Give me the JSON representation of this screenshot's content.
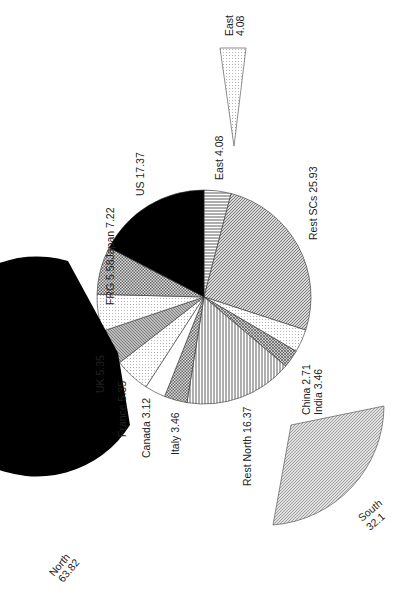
{
  "chart_data": {
    "type": "pie",
    "title": "",
    "orientation": "rotated 90 degrees counter-clockwise",
    "main_pie": {
      "slices": [
        {
          "label": "East",
          "value": 4.08,
          "pattern": "hlines"
        },
        {
          "label": "Rest SCs",
          "value": 25.93,
          "pattern": "diag"
        },
        {
          "label": "India",
          "value": 3.46,
          "pattern": "dots"
        },
        {
          "label": "China",
          "value": 2.71,
          "pattern": "cross"
        },
        {
          "label": "Rest North",
          "value": 16.37,
          "pattern": "vlines"
        },
        {
          "label": "Italy",
          "value": 3.46,
          "pattern": "checker"
        },
        {
          "label": "Canada",
          "value": 3.12,
          "pattern": "white"
        },
        {
          "label": "France",
          "value": 5.35,
          "pattern": "dots"
        },
        {
          "label": "UK",
          "value": 5.35,
          "pattern": "diag2"
        },
        {
          "label": "FRG",
          "value": 5.58,
          "pattern": "dots"
        },
        {
          "label": "Japan",
          "value": 7.22,
          "pattern": "checker"
        },
        {
          "label": "US",
          "value": 17.37,
          "pattern": "black"
        }
      ]
    },
    "exploded_groups": [
      {
        "label": "North",
        "value": 63.82,
        "pattern": "black"
      },
      {
        "label": "South",
        "value": 32.1,
        "pattern": "diag"
      },
      {
        "label": "East",
        "value": 4.08,
        "pattern": "dots"
      }
    ]
  },
  "labels": {
    "us": "US  17.37",
    "east_main": "East  4.08",
    "rest_scs": "Rest SCs  25.93",
    "frg_japan": "FRG  5.58Japan  7.22",
    "uk": "UK  5.35",
    "france": "France  5.35",
    "canada": "Canada  3.12",
    "italy": "Italy  3.46",
    "rest_north": "Rest North  16.37",
    "china": "China  2.71",
    "india": "India  3.46",
    "north_name": "North",
    "north_value": "63.82",
    "south_name": "South",
    "south_value": "32.1",
    "east_name": "East",
    "east_value": "4.08"
  }
}
